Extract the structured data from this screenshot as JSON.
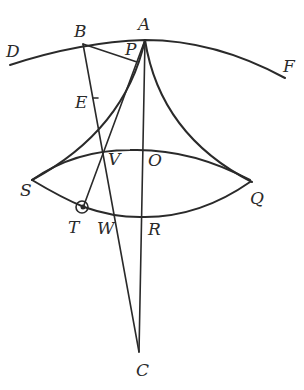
{
  "diagram": {
    "type": "geometric-construction",
    "stroke_color": "#2a2a2a",
    "background": "#ffffff",
    "points": {
      "A": {
        "label": "A",
        "x": 145,
        "y": 40,
        "lx": 138,
        "ly": 30
      },
      "B": {
        "label": "B",
        "x": 83,
        "y": 44,
        "lx": 74,
        "ly": 37
      },
      "D": {
        "label": "D",
        "x": 10,
        "y": 65,
        "lx": 6,
        "ly": 57
      },
      "F": {
        "label": "F",
        "x": 285,
        "y": 78,
        "lx": 283,
        "ly": 70
      },
      "P": {
        "label": "P",
        "x": 137,
        "y": 62,
        "lx": 125,
        "ly": 55
      },
      "E": {
        "label": "E",
        "x": 96,
        "y": 98,
        "lx": 76,
        "ly": 108
      },
      "V": {
        "label": "V",
        "x": 101,
        "y": 152,
        "lx": 108,
        "ly": 165
      },
      "O": {
        "label": "O",
        "x": 144,
        "y": 150,
        "lx": 148,
        "ly": 166
      },
      "S": {
        "label": "S",
        "x": 32,
        "y": 180,
        "lx": 20,
        "ly": 195
      },
      "Q": {
        "label": "Q",
        "x": 250,
        "y": 182,
        "lx": 250,
        "ly": 203
      },
      "T": {
        "label": "T",
        "x": 82,
        "y": 208,
        "lx": 68,
        "ly": 233
      },
      "W": {
        "label": "W",
        "x": 114,
        "y": 215,
        "lx": 97,
        "ly": 233
      },
      "R": {
        "label": "R",
        "x": 143,
        "y": 217,
        "lx": 148,
        "ly": 235
      },
      "C": {
        "label": "C",
        "x": 139,
        "y": 352,
        "lx": 136,
        "ly": 376
      }
    },
    "curves": [
      {
        "name": "arc-DBAF",
        "description": "large arc through D, B, A, F"
      },
      {
        "name": "cusp-arc-AS",
        "description": "concave arc from A to S"
      },
      {
        "name": "cusp-arc-AQ",
        "description": "concave arc from A to Q"
      },
      {
        "name": "arc-SVOQ",
        "description": "upper arc from S through V and O to Q"
      },
      {
        "name": "arc-STWRQ",
        "description": "lower arc from S through T, W, R to Q"
      }
    ],
    "segments": [
      {
        "name": "segment-BP",
        "from": "B",
        "to": "P"
      },
      {
        "name": "segment-BC",
        "from": "B",
        "to": "C"
      },
      {
        "name": "segment-AC",
        "from": "A",
        "to": "C"
      },
      {
        "name": "segment-AT",
        "from": "A",
        "to": "T"
      },
      {
        "name": "segment-TW",
        "from": "T",
        "to": "W"
      }
    ],
    "circles": [
      {
        "name": "small-circle-T",
        "at": "T",
        "r": 6
      }
    ]
  }
}
